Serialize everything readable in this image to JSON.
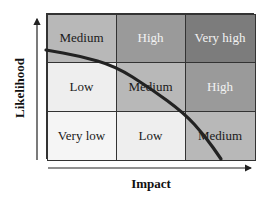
{
  "axes": {
    "x_label": "Impact",
    "y_label": "Likelihood"
  },
  "grid": {
    "rows": [
      [
        {
          "label": "Medium",
          "bg": "#b8b8b8",
          "fg": "#1a1a1a"
        },
        {
          "label": "High",
          "bg": "#9a9a9a",
          "fg": "#f2f2f2"
        },
        {
          "label": "Very high",
          "bg": "#7c7c7c",
          "fg": "#f2f2f2"
        }
      ],
      [
        {
          "label": "Low",
          "bg": "#eeeeee",
          "fg": "#1a1a1a"
        },
        {
          "label": "Medium",
          "bg": "#b8b8b8",
          "fg": "#1a1a1a"
        },
        {
          "label": "High",
          "bg": "#9a9a9a",
          "fg": "#f2f2f2"
        }
      ],
      [
        {
          "label": "Very low",
          "bg": "#f5f5f5",
          "fg": "#1a1a1a"
        },
        {
          "label": "Low",
          "bg": "#eeeeee",
          "fg": "#1a1a1a"
        },
        {
          "label": "Medium",
          "bg": "#b8b8b8",
          "fg": "#1a1a1a"
        }
      ]
    ]
  },
  "curve": {
    "description": "Risk tolerance boundary curve",
    "color": "#222222",
    "points": [
      [
        46,
        50
      ],
      [
        80,
        56
      ],
      [
        115,
        66
      ],
      [
        150,
        88
      ],
      [
        184,
        113
      ],
      [
        205,
        136
      ],
      [
        221,
        159
      ]
    ]
  }
}
